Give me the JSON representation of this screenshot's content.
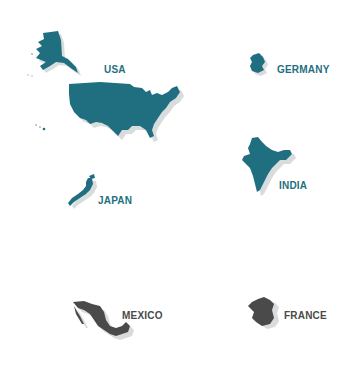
{
  "colors": {
    "teal": "#1f6f80",
    "gray": "#4a4a4a",
    "shadow": "#d9dcdc",
    "background": "#ffffff"
  },
  "countries": [
    {
      "name": "USA",
      "color_key": "teal"
    },
    {
      "name": "GERMANY",
      "color_key": "teal"
    },
    {
      "name": "INDIA",
      "color_key": "teal"
    },
    {
      "name": "JAPAN",
      "color_key": "teal"
    },
    {
      "name": "MEXICO",
      "color_key": "gray"
    },
    {
      "name": "FRANCE",
      "color_key": "gray"
    }
  ]
}
